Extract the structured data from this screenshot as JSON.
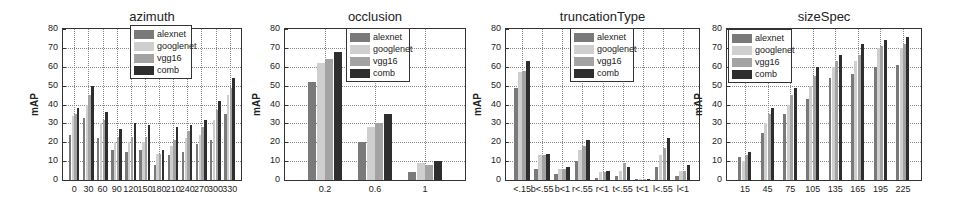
{
  "colors": {
    "alexnet": "#7a7a7a",
    "googlenet": "#cfcfcf",
    "vgg16": "#a3a3a3",
    "comb": "#2e2e2e"
  },
  "legend": [
    "alexnet",
    "googlenet",
    "vgg16",
    "comb"
  ],
  "chart_data": [
    {
      "type": "bar",
      "title": "azimuth",
      "xlabel": "",
      "ylabel": "mAP",
      "ylim": [
        0,
        80
      ],
      "yticks": [
        0,
        10,
        20,
        30,
        40,
        50,
        60,
        70,
        80
      ],
      "grid": true,
      "legend_position": "upper center",
      "categories": [
        "0",
        "30",
        "60",
        "90",
        "120",
        "150",
        "180",
        "210",
        "240",
        "270",
        "300",
        "330"
      ],
      "series": [
        {
          "name": "alexnet",
          "values": [
            24,
            33,
            22,
            16,
            15,
            16,
            8,
            13,
            15,
            19,
            21,
            35
          ]
        },
        {
          "name": "googlenet",
          "values": [
            34,
            40,
            30,
            20,
            20,
            20,
            14,
            18,
            22,
            24,
            32,
            45
          ]
        },
        {
          "name": "vgg16",
          "values": [
            35,
            45,
            32,
            23,
            23,
            23,
            14,
            21,
            26,
            28,
            37,
            49
          ]
        },
        {
          "name": "comb",
          "values": [
            38,
            50,
            36,
            27,
            30,
            29,
            16,
            28,
            29,
            32,
            42,
            54
          ]
        }
      ]
    },
    {
      "type": "bar",
      "title": "occlusion",
      "xlabel": "",
      "ylabel": "mAP",
      "ylim": [
        0,
        80
      ],
      "yticks": [
        0,
        10,
        20,
        30,
        40,
        50,
        60,
        70,
        80
      ],
      "grid": true,
      "legend_position": "upper center",
      "categories": [
        "0.2",
        "0.6",
        "1"
      ],
      "series": [
        {
          "name": "alexnet",
          "values": [
            52,
            20,
            4
          ]
        },
        {
          "name": "googlenet",
          "values": [
            62,
            28,
            9
          ]
        },
        {
          "name": "vgg16",
          "values": [
            64,
            30,
            8
          ]
        },
        {
          "name": "comb",
          "values": [
            68,
            35,
            10
          ]
        }
      ]
    },
    {
      "type": "bar",
      "title": "truncationType",
      "xlabel": "",
      "ylabel": "mAP",
      "ylim": [
        0,
        80
      ],
      "yticks": [
        0,
        10,
        20,
        30,
        40,
        50,
        60,
        70,
        80
      ],
      "grid": true,
      "legend_position": "upper center",
      "categories": [
        "<.15",
        "b<.55",
        "b<1",
        "r<.55",
        "r<1",
        "t<.55",
        "t<1",
        "l<.55",
        "l<1"
      ],
      "series": [
        {
          "name": "alexnet",
          "values": [
            49,
            6,
            3,
            10,
            1,
            2,
            0.5,
            7,
            2
          ]
        },
        {
          "name": "googlenet",
          "values": [
            57,
            13,
            6,
            16,
            4,
            5,
            0.5,
            13,
            5
          ]
        },
        {
          "name": "vgg16",
          "values": [
            58,
            13,
            6,
            18,
            4,
            9,
            0.5,
            17,
            5
          ]
        },
        {
          "name": "comb",
          "values": [
            63,
            14,
            7,
            21,
            5,
            7,
            0.3,
            22,
            8
          ]
        }
      ]
    },
    {
      "type": "bar",
      "title": "sizeSpec",
      "xlabel": "",
      "ylabel": "mAP",
      "ylim": [
        0,
        80
      ],
      "yticks": [
        0,
        10,
        20,
        30,
        40,
        50,
        60,
        70,
        80
      ],
      "grid": true,
      "legend_position": "upper left",
      "categories": [
        "15",
        "45",
        "75",
        "105",
        "135",
        "165",
        "195",
        "225"
      ],
      "series": [
        {
          "name": "alexnet",
          "values": [
            12,
            25,
            35,
            43,
            54,
            56,
            60,
            61
          ]
        },
        {
          "name": "googlenet",
          "values": [
            10,
            30,
            40,
            50,
            60,
            63,
            70,
            70
          ]
        },
        {
          "name": "vgg16",
          "values": [
            13,
            35,
            45,
            55,
            63,
            66,
            71,
            72
          ]
        },
        {
          "name": "comb",
          "values": [
            15,
            38,
            49,
            60,
            66,
            72,
            74,
            76
          ]
        }
      ]
    }
  ],
  "layout": [
    {
      "chartLeft": 0,
      "chartWidth": 245,
      "plotLeft": 62,
      "plotTop": 28,
      "plotWidth": 180,
      "plotHeight": 153,
      "legendLeft": 130,
      "legendTop": 25,
      "legendWidth": 62,
      "groupFill": 0.78
    },
    {
      "chartLeft": 245,
      "chartWidth": 232,
      "plotLeft": 284,
      "plotTop": 28,
      "plotWidth": 182,
      "plotHeight": 153,
      "legendLeft": 346,
      "legendTop": 28,
      "legendWidth": 64,
      "groupFill": 0.68
    },
    {
      "chartLeft": 477,
      "chartWidth": 240,
      "plotLeft": 505,
      "plotTop": 28,
      "plotWidth": 195,
      "plotHeight": 153,
      "legendLeft": 570,
      "legendTop": 28,
      "legendWidth": 64,
      "groupFill": 0.78
    },
    {
      "chartLeft": 717,
      "chartWidth": 242,
      "plotLeft": 726,
      "plotTop": 28,
      "plotWidth": 196,
      "plotHeight": 153,
      "legendLeft": 728,
      "legendTop": 29,
      "legendWidth": 64,
      "groupFill": 0.6
    }
  ]
}
